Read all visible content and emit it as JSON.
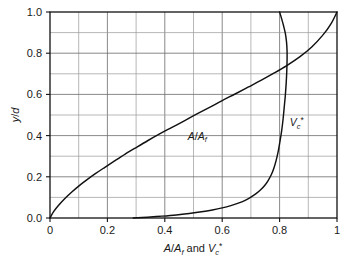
{
  "chart_data": {
    "type": "line",
    "title": "",
    "subtitle": "",
    "xlabel": "A/A_f and V_c*",
    "ylabel": "y/d",
    "xlim": [
      0,
      1
    ],
    "ylim": [
      0,
      1
    ],
    "grid": true,
    "grid_step_x": 0.1,
    "grid_step_y": 0.1,
    "legend": "inline-curve-labels",
    "xticks": [
      0,
      0.2,
      0.4,
      0.6,
      0.8,
      1
    ],
    "xticklabels": [
      "0",
      "0.2",
      "0.4",
      "0.6",
      "0.8",
      "1"
    ],
    "yticks": [
      0.0,
      0.2,
      0.4,
      0.6,
      0.8,
      1.0
    ],
    "yticklabels": [
      "0.0",
      "0.2",
      "0.4",
      "0.6",
      "0.8",
      "1.0"
    ],
    "series": [
      {
        "name": "A/A_f",
        "label_x": 0.48,
        "label_y": 0.38,
        "x": [
          0.0,
          0.012,
          0.03,
          0.052,
          0.075,
          0.1,
          0.128,
          0.158,
          0.19,
          0.225,
          0.262,
          0.3,
          0.34,
          0.382,
          0.425,
          0.468,
          0.512,
          0.556,
          0.6,
          0.645,
          0.69,
          0.735,
          0.78,
          0.825,
          0.87,
          0.912,
          0.952,
          0.98,
          1.0
        ],
        "y": [
          0.0,
          0.03,
          0.062,
          0.095,
          0.125,
          0.155,
          0.185,
          0.215,
          0.245,
          0.277,
          0.31,
          0.342,
          0.375,
          0.408,
          0.44,
          0.472,
          0.505,
          0.537,
          0.57,
          0.602,
          0.635,
          0.668,
          0.703,
          0.74,
          0.782,
          0.83,
          0.89,
          0.945,
          1.0
        ]
      },
      {
        "name": "V_c*",
        "label_x": 0.835,
        "label_y": 0.445,
        "x": [
          0.29,
          0.34,
          0.39,
          0.44,
          0.485,
          0.528,
          0.566,
          0.6,
          0.63,
          0.656,
          0.68,
          0.7,
          0.718,
          0.734,
          0.748,
          0.76,
          0.771,
          0.78,
          0.788,
          0.795,
          0.801,
          0.807,
          0.812,
          0.816,
          0.82,
          0.823,
          0.825,
          0.826,
          0.826,
          0.824,
          0.82,
          0.814,
          0.807,
          0.8
        ],
        "y": [
          0.0,
          0.004,
          0.009,
          0.015,
          0.022,
          0.03,
          0.039,
          0.049,
          0.06,
          0.072,
          0.086,
          0.101,
          0.118,
          0.137,
          0.158,
          0.182,
          0.21,
          0.242,
          0.28,
          0.322,
          0.37,
          0.422,
          0.478,
          0.536,
          0.596,
          0.656,
          0.712,
          0.764,
          0.812,
          0.856,
          0.896,
          0.932,
          0.968,
          1.0
        ]
      }
    ]
  },
  "axes": {
    "ylabel_text": "y/d",
    "xlabel_parts": {
      "a": "A",
      "slash": "/",
      "af": "A",
      "f_sub": "f",
      "and": "and",
      "v": "V",
      "c_sub": "c",
      "star": "*"
    }
  },
  "curve_labels": {
    "a_over_af": {
      "a": "A",
      "slash": "/",
      "a2": "A",
      "sub": "f"
    },
    "vc_star": {
      "v": "V",
      "sub": "c",
      "sup": "*"
    }
  },
  "colors": {
    "curve": "#111111",
    "frame": "#111111",
    "grid_major": "#6b6b6b",
    "grid_minor": "#9a9a9a",
    "background": "#ffffff",
    "text": "#1a1a1a"
  }
}
